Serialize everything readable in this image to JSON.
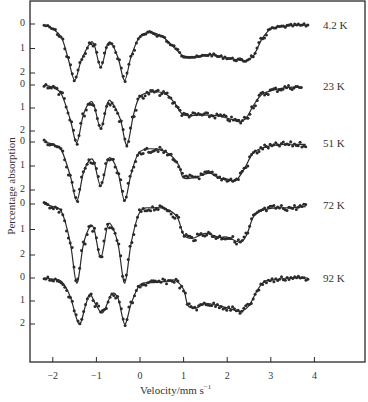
{
  "chart_data": {
    "type": "line",
    "title": "",
    "xlabel": "Velocity/mm s",
    "xlabel_superscript": "−1",
    "ylabel": "Percentage  absorption",
    "xlim": [
      -2.3,
      5.0
    ],
    "x_ticks": [
      -2,
      -1,
      0,
      1,
      2,
      3,
      4
    ],
    "x_tick_labels": [
      "−2",
      "−1",
      "0",
      "1",
      "2",
      "3",
      "4"
    ],
    "y_tick_labels_per_spectrum": [
      "0",
      "1",
      "2"
    ],
    "grid": false,
    "legend": "none (temperature labels placed at right end of each spectrum)",
    "note": "Stacked Mössbauer spectra; each spectrum has its own 0–2 % absorption scale. Dots = data, line = fit.",
    "series": [
      {
        "name": "4.2 K",
        "x": [
          -2.2,
          -2.0,
          -1.8,
          -1.65,
          -1.5,
          -1.35,
          -1.15,
          -1.05,
          -0.9,
          -0.75,
          -0.65,
          -0.5,
          -0.35,
          -0.2,
          0.0,
          0.25,
          0.5,
          0.75,
          1.0,
          1.3,
          1.6,
          1.9,
          2.2,
          2.4,
          2.6,
          2.8,
          3.0,
          3.3,
          3.6,
          3.85
        ],
        "values": [
          0.05,
          0.2,
          0.55,
          1.4,
          2.3,
          1.5,
          0.8,
          0.85,
          1.75,
          0.85,
          0.8,
          1.4,
          2.3,
          1.3,
          0.5,
          0.35,
          0.5,
          0.9,
          1.3,
          1.35,
          1.25,
          1.35,
          1.45,
          1.5,
          1.3,
          0.6,
          0.2,
          0.1,
          0.05,
          0.05
        ]
      },
      {
        "name": "23 K",
        "x": [
          -2.2,
          -2.0,
          -1.8,
          -1.6,
          -1.45,
          -1.3,
          -1.15,
          -1.05,
          -0.9,
          -0.75,
          -0.65,
          -0.45,
          -0.3,
          -0.15,
          0.0,
          0.3,
          0.6,
          0.8,
          1.0,
          1.4,
          1.8,
          2.1,
          2.3,
          2.45,
          2.6,
          2.8,
          3.1,
          3.4,
          3.7
        ],
        "values": [
          0.0,
          0.1,
          0.4,
          1.5,
          2.5,
          1.3,
          0.75,
          0.9,
          1.9,
          0.8,
          0.75,
          1.5,
          2.6,
          1.3,
          0.5,
          0.3,
          0.4,
          0.8,
          1.3,
          1.3,
          1.35,
          1.5,
          1.6,
          1.4,
          0.9,
          0.4,
          0.2,
          0.1,
          0.1
        ]
      },
      {
        "name": "51 K",
        "x": [
          -2.2,
          -2.0,
          -1.8,
          -1.6,
          -1.45,
          -1.3,
          -1.15,
          -1.05,
          -0.9,
          -0.75,
          -0.65,
          -0.5,
          -0.35,
          -0.2,
          0.0,
          0.4,
          0.7,
          0.9,
          1.0,
          1.3,
          1.6,
          1.8,
          2.0,
          2.2,
          2.4,
          2.6,
          2.9,
          3.3,
          3.8
        ],
        "values": [
          0.0,
          0.1,
          0.35,
          1.4,
          2.45,
          1.3,
          0.75,
          0.85,
          1.85,
          0.8,
          0.7,
          1.3,
          2.45,
          1.3,
          0.4,
          0.3,
          0.55,
          1.0,
          1.5,
          1.45,
          1.3,
          1.5,
          1.55,
          1.6,
          1.1,
          0.45,
          0.2,
          0.1,
          0.1
        ]
      },
      {
        "name": "72 K",
        "x": [
          -2.2,
          -2.0,
          -1.8,
          -1.6,
          -1.45,
          -1.3,
          -1.15,
          -1.05,
          -0.9,
          -0.75,
          -0.65,
          -0.5,
          -0.35,
          -0.2,
          0.0,
          0.3,
          0.6,
          0.85,
          1.0,
          1.2,
          1.5,
          1.8,
          2.0,
          2.3,
          2.45,
          2.6,
          2.8,
          3.1,
          3.4,
          3.8
        ],
        "values": [
          0.0,
          0.1,
          0.3,
          1.5,
          3.1,
          1.6,
          0.9,
          1.0,
          2.1,
          0.9,
          0.85,
          1.6,
          3.1,
          1.5,
          0.3,
          0.15,
          0.2,
          0.5,
          1.2,
          1.35,
          1.15,
          1.3,
          1.3,
          1.5,
          1.2,
          0.5,
          0.25,
          0.15,
          0.15,
          0.1
        ]
      },
      {
        "name": "92 K",
        "x": [
          -2.2,
          -2.0,
          -1.8,
          -1.6,
          -1.4,
          -1.25,
          -1.15,
          -1.0,
          -0.85,
          -0.65,
          -0.5,
          -0.35,
          -0.2,
          0.0,
          0.3,
          0.6,
          0.8,
          1.0,
          1.1,
          1.3,
          1.5,
          1.8,
          2.1,
          2.3,
          2.5,
          2.7,
          2.85,
          3.0,
          3.4,
          3.85
        ],
        "values": [
          0.0,
          0.05,
          0.15,
          0.8,
          2.0,
          1.2,
          0.7,
          1.2,
          1.5,
          0.7,
          0.9,
          2.0,
          1.1,
          0.3,
          0.2,
          0.15,
          0.1,
          0.5,
          1.2,
          1.3,
          1.1,
          1.2,
          1.35,
          1.45,
          1.2,
          0.5,
          0.15,
          0.1,
          0.0,
          0.0
        ]
      }
    ]
  },
  "labels": {
    "ylabel": "Percentage  absorption",
    "xlabel": "Velocity/mm s",
    "xlabel_sup": "−1",
    "temps": [
      "4.2 K",
      "23 K",
      "51 K",
      "72 K",
      "92 K"
    ]
  }
}
